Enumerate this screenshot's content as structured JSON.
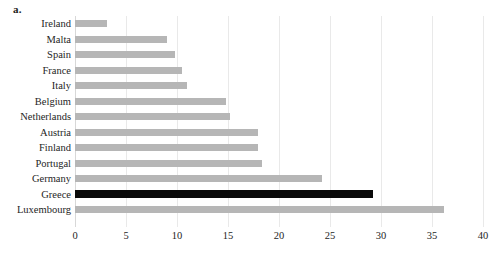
{
  "panel": {
    "label": "a."
  },
  "chart_data": {
    "type": "bar",
    "orientation": "horizontal",
    "title": "",
    "xlabel": "",
    "ylabel": "",
    "xlim": [
      0,
      40
    ],
    "xticks": [
      0,
      5,
      10,
      15,
      20,
      25,
      30,
      35,
      40
    ],
    "grid": "vertical",
    "legend": "none",
    "categories": [
      "Ireland",
      "Malta",
      "Spain",
      "France",
      "Italy",
      "Belgium",
      "Netherlands",
      "Austria",
      "Finland",
      "Portugal",
      "Germany",
      "Greece",
      "Luxembourg"
    ],
    "values": [
      3.1,
      9.0,
      9.8,
      10.5,
      11.0,
      14.8,
      15.2,
      17.9,
      17.9,
      18.3,
      24.2,
      29.2,
      36.2
    ],
    "highlight_category": "Greece",
    "colors": {
      "bar": "#b6b6b6",
      "highlight_bar": "#0a0a0a",
      "gridline": "#e9e9e9",
      "axis": "#d8d8d8",
      "text": "#252525",
      "background": "#ffffff"
    }
  }
}
